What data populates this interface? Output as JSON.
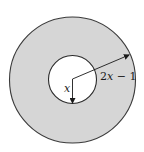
{
  "figure": {
    "outer_circle": {
      "cx": 72.5,
      "cy": 80,
      "r": 63,
      "fill": "#d6d6d6",
      "stroke": "#3a3a3a"
    },
    "inner_circle": {
      "cx": 72.5,
      "cy": 79.5,
      "r": 24,
      "fill": "#ffffff",
      "stroke": "#2a2a2a"
    },
    "labels": {
      "inner_radius": "x",
      "outer_radius": "2x − 1"
    }
  }
}
